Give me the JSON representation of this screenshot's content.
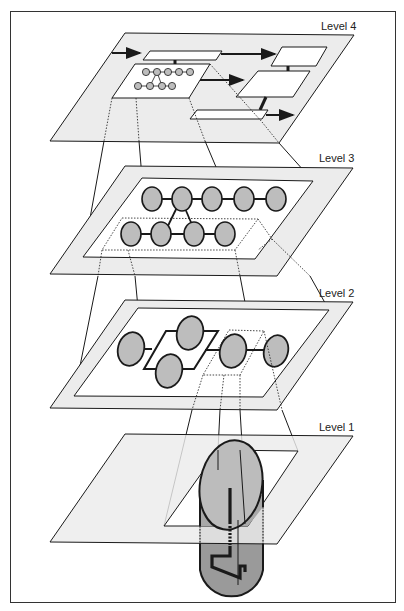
{
  "diagram": {
    "type": "layered-abstraction",
    "colors": {
      "plane_fill": "#ececec",
      "window_fill": "#ffffff",
      "node_fill": "#bdbdbd",
      "cylinder_top": "#b8b8b8",
      "cylinder_body": "#9a9a9a",
      "stroke": "#1a1a1a"
    },
    "levels": [
      {
        "id": 4,
        "label": "Level 4",
        "content": "block diagram with boxes and arrows; one box contains a miniature of the Level 3 node network"
      },
      {
        "id": 3,
        "label": "Level 3",
        "content": "node network: 5 nodes top row, 4 nodes bottom row, connected by triangle"
      },
      {
        "id": 2,
        "label": "Level 2",
        "content": "node graph: 1 node, parallel pair of nodes, then 2 nodes in series"
      },
      {
        "id": 1,
        "label": "Level 1",
        "content": "physical cylinder component with zigzag conductor passing through the plane"
      }
    ]
  }
}
